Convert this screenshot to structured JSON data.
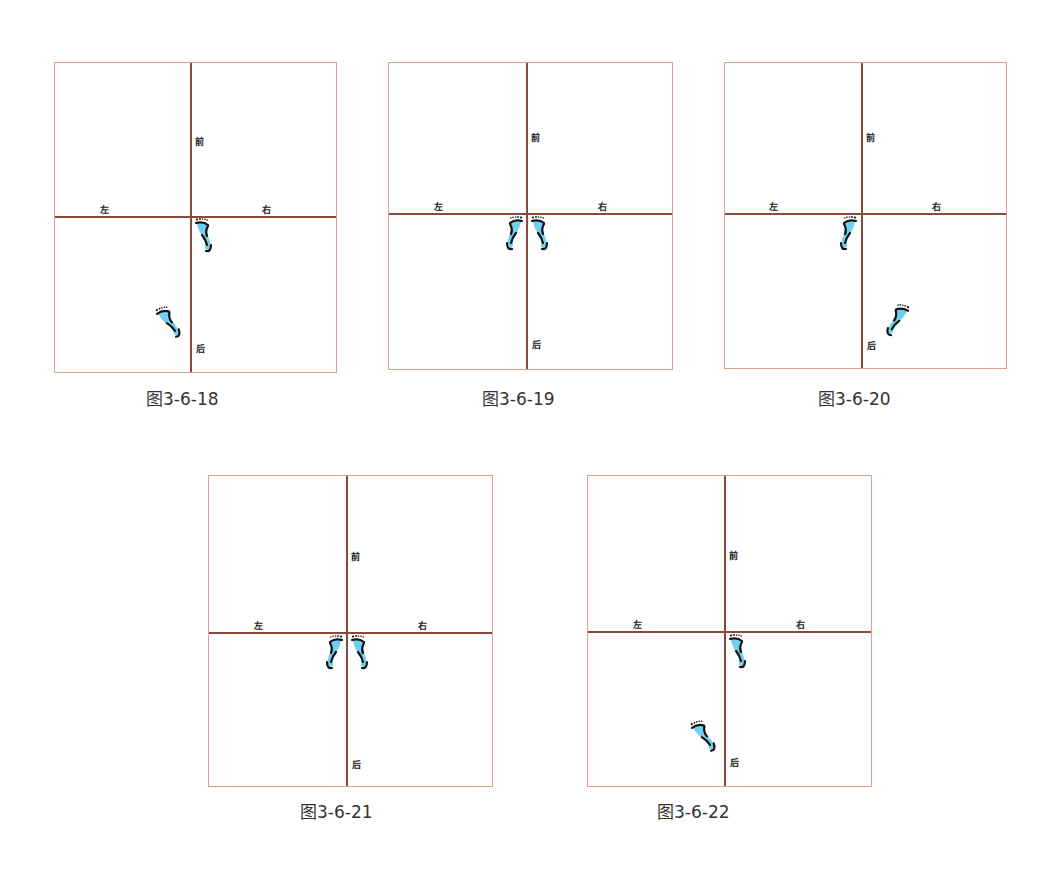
{
  "labels": {
    "front": "前",
    "back": "后",
    "left": "左",
    "right": "右"
  },
  "colors": {
    "frame_border": "#e0a090",
    "axis": "#8a4a3a",
    "foot_fill": "#6fd0f0",
    "foot_stroke": "#111111"
  },
  "figures": [
    {
      "caption": "图3-6-18",
      "feet": [
        {
          "side": "right",
          "position": "at-origin",
          "orientation": "forward"
        },
        {
          "side": "left",
          "position": "back-left",
          "orientation": "forward-angled"
        }
      ]
    },
    {
      "caption": "图3-6-19",
      "feet": [
        {
          "side": "left",
          "position": "at-origin",
          "orientation": "forward"
        },
        {
          "side": "right",
          "position": "at-origin",
          "orientation": "forward"
        }
      ]
    },
    {
      "caption": "图3-6-20",
      "feet": [
        {
          "side": "left",
          "position": "at-origin",
          "orientation": "forward"
        },
        {
          "side": "right",
          "position": "back-right",
          "orientation": "forward-angled"
        }
      ]
    },
    {
      "caption": "图3-6-21",
      "feet": [
        {
          "side": "left",
          "position": "at-origin",
          "orientation": "forward"
        },
        {
          "side": "right",
          "position": "at-origin",
          "orientation": "forward"
        }
      ]
    },
    {
      "caption": "图3-6-22",
      "feet": [
        {
          "side": "right",
          "position": "at-origin",
          "orientation": "forward"
        },
        {
          "side": "left",
          "position": "back-left",
          "orientation": "forward-angled"
        }
      ]
    }
  ]
}
